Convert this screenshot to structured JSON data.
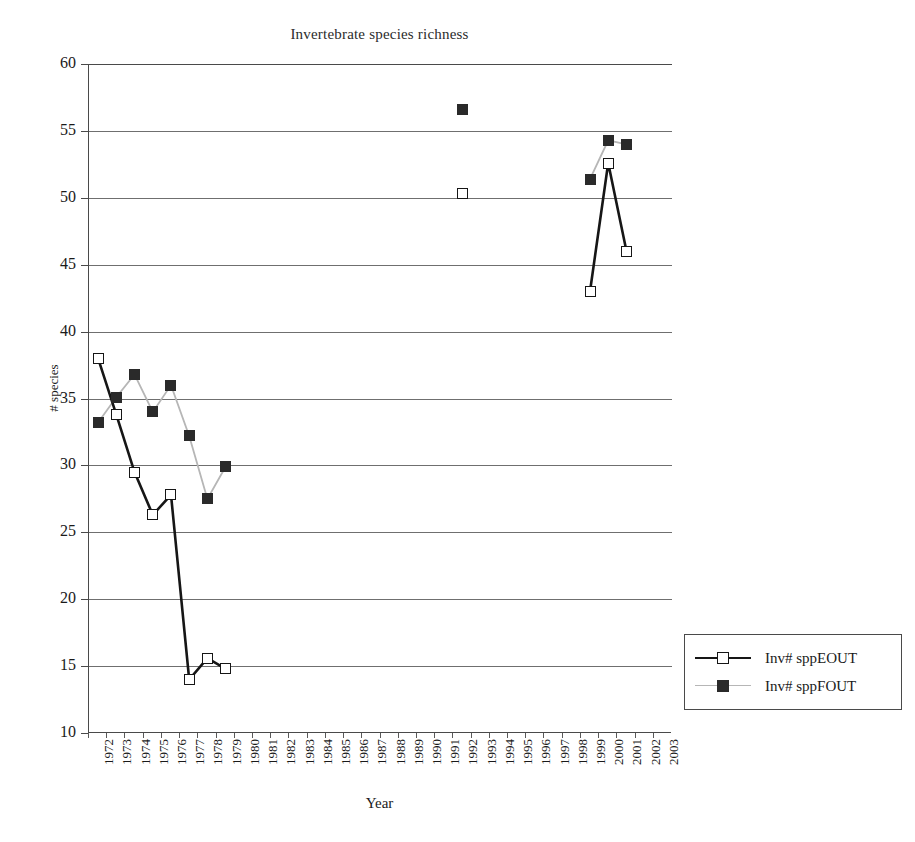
{
  "chart_data": {
    "type": "line",
    "title": "Invertebrate species richness",
    "xlabel": "Year",
    "ylabel": "# species",
    "ylim": [
      10,
      60
    ],
    "ytick_step": 5,
    "yticks": [
      60,
      55,
      50,
      45,
      40,
      35,
      30,
      25,
      20,
      15,
      10
    ],
    "grid": true,
    "legend_position": "right-outside",
    "categories": [
      "1972",
      "1973",
      "1974",
      "1975",
      "1976",
      "1977",
      "1978",
      "1979",
      "1980",
      "1981",
      "1982",
      "1983",
      "1984",
      "1985",
      "1986",
      "1987",
      "1988",
      "1989",
      "1990",
      "1991",
      "1992",
      "1993",
      "1994",
      "1995",
      "1996",
      "1997",
      "1998",
      "1999",
      "2000",
      "2001",
      "2002",
      "2003"
    ],
    "series": [
      {
        "name": "Inv# sppEOUT",
        "marker": "open-square",
        "color": "#161616",
        "line_color": "#161616",
        "points": [
          {
            "x": "1972",
            "y": 38.0
          },
          {
            "x": "1973",
            "y": 33.8
          },
          {
            "x": "1974",
            "y": 29.5
          },
          {
            "x": "1975",
            "y": 26.3
          },
          {
            "x": "1976",
            "y": 27.8
          },
          {
            "x": "1977",
            "y": 14.0
          },
          {
            "x": "1978",
            "y": 15.6
          },
          {
            "x": "1979",
            "y": 14.8
          },
          {
            "x": "1992",
            "y": 50.3
          },
          {
            "x": "1999",
            "y": 43.0
          },
          {
            "x": "2000",
            "y": 52.6
          },
          {
            "x": "2001",
            "y": 46.0
          }
        ],
        "segments": [
          [
            "1972",
            "1973",
            "1974",
            "1975",
            "1976",
            "1977",
            "1978",
            "1979"
          ],
          [
            "1999",
            "2000",
            "2001"
          ]
        ]
      },
      {
        "name": "Inv# sppFOUT",
        "marker": "filled-square",
        "color": "#2a2a2a",
        "line_color": "#b6b6b6",
        "points": [
          {
            "x": "1972",
            "y": 33.2
          },
          {
            "x": "1973",
            "y": 35.1
          },
          {
            "x": "1974",
            "y": 36.8
          },
          {
            "x": "1975",
            "y": 34.0
          },
          {
            "x": "1976",
            "y": 36.0
          },
          {
            "x": "1977",
            "y": 32.2
          },
          {
            "x": "1978",
            "y": 27.5
          },
          {
            "x": "1979",
            "y": 29.9
          },
          {
            "x": "1992",
            "y": 56.6
          },
          {
            "x": "1999",
            "y": 51.4
          },
          {
            "x": "2000",
            "y": 54.3
          },
          {
            "x": "2001",
            "y": 54.0
          }
        ],
        "segments": [
          [
            "1972",
            "1973",
            "1974",
            "1975",
            "1976",
            "1977",
            "1978",
            "1979"
          ],
          [
            "1999",
            "2000",
            "2001"
          ]
        ]
      }
    ]
  }
}
